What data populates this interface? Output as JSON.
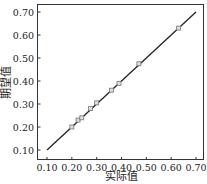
{
  "chart_data": {
    "type": "scatter",
    "title": "",
    "xlabel": "实际值",
    "ylabel": "期望值",
    "xlim": [
      0.1,
      0.7
    ],
    "ylim": [
      0.1,
      0.7
    ],
    "xticks": [
      "0.10",
      "0.20",
      "0.30",
      "0.40",
      "0.50",
      "0.60",
      "0.70"
    ],
    "yticks": [
      "0.10",
      "0.20",
      "0.30",
      "0.40",
      "0.50",
      "0.60",
      "0.70"
    ],
    "grid": false,
    "legend": null,
    "series": [
      {
        "name": "data points",
        "type": "scatter",
        "marker": "square",
        "x": [
          0.2,
          0.225,
          0.24,
          0.275,
          0.3,
          0.36,
          0.39,
          0.47,
          0.63
        ],
        "y": [
          0.2,
          0.23,
          0.24,
          0.28,
          0.305,
          0.36,
          0.39,
          0.475,
          0.63
        ]
      },
      {
        "name": "y = x",
        "type": "line",
        "x": [
          0.1,
          0.7
        ],
        "y": [
          0.1,
          0.7
        ]
      }
    ]
  }
}
